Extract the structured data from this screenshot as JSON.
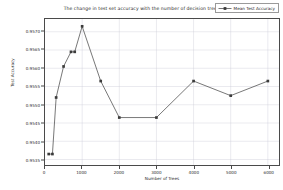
{
  "chart_data": {
    "type": "line",
    "title": "The change in test set accuracy with the number of decision trees",
    "xlabel": "Number of Trees",
    "ylabel": "Test Accuracy",
    "grid": true,
    "legend_position": "upper right",
    "xlim": [
      0,
      6300
    ],
    "ylim": [
      0.95335,
      0.95735
    ],
    "xticks": [
      0,
      1000,
      2000,
      3000,
      4000,
      5000,
      6000
    ],
    "xticklabels": [
      "0",
      "1000",
      "2000",
      "3000",
      "4000",
      "5000",
      "6000"
    ],
    "yticks": [
      0.9535,
      0.954,
      0.9545,
      0.955,
      0.9555,
      0.956,
      0.9565,
      0.957
    ],
    "yticklabels": [
      "0.9535",
      "0.9540",
      "0.9545",
      "0.9550",
      "0.9555",
      "0.9560",
      "0.9565",
      "0.9570"
    ],
    "series": [
      {
        "name": "Mean Test Accuracy",
        "color": "#3b3b3b",
        "marker": "square",
        "x": [
          100,
          200,
          300,
          500,
          700,
          800,
          1000,
          1500,
          2000,
          3000,
          4000,
          5000,
          6000
        ],
        "values": [
          0.95365,
          0.95365,
          0.9552,
          0.95605,
          0.95645,
          0.95645,
          0.95715,
          0.95565,
          0.95465,
          0.95465,
          0.95565,
          0.95525,
          0.95565
        ]
      }
    ]
  },
  "legend": {
    "entries": [
      {
        "label": "Mean Test Accuracy"
      }
    ]
  }
}
